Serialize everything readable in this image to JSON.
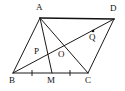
{
  "figure": {
    "background_color": "#ffffff",
    "stroke_color": "#1a1a1a",
    "points": {
      "A": {
        "label": "A",
        "x": 40,
        "y": 18,
        "label_x": 36,
        "label_y": 3
      },
      "B": {
        "label": "B",
        "x": 13,
        "y": 73,
        "label_x": 9,
        "label_y": 76
      },
      "C": {
        "label": "C",
        "x": 88,
        "y": 73,
        "label_x": 85,
        "label_y": 76
      },
      "D": {
        "label": "D",
        "x": 114,
        "y": 19,
        "label_x": 110,
        "label_y": 4
      },
      "M": {
        "label": "M",
        "x": 52,
        "y": 73,
        "label_x": 47,
        "label_y": 76
      },
      "O": {
        "label": "O",
        "x": 62,
        "y": 49,
        "label_x": 58,
        "label_y": 50
      },
      "P": {
        "label": "P",
        "x": 43,
        "y": 54,
        "label_x": 34,
        "label_y": 47
      },
      "Q": {
        "label": "Q",
        "x": 93,
        "y": 31,
        "label_x": 89,
        "label_y": 33
      }
    },
    "segments": [
      {
        "name": "side-AD",
        "from": "A",
        "to": "D",
        "weight": "thick"
      },
      {
        "name": "side-AB",
        "from": "A",
        "to": "B",
        "weight": "normal"
      },
      {
        "name": "side-BC",
        "from": "B",
        "to": "C",
        "weight": "normal"
      },
      {
        "name": "side-DC",
        "from": "D",
        "to": "C",
        "weight": "normal"
      },
      {
        "name": "median-AM",
        "from": "A",
        "to": "M",
        "weight": "normal"
      },
      {
        "name": "diagonal-AC",
        "from": "A",
        "to": "C",
        "weight": "normal"
      },
      {
        "name": "diagonal-BD",
        "from": "B",
        "to": "D",
        "weight": "normal"
      }
    ],
    "tick_marks": [
      {
        "name": "tick-BM",
        "x": 32,
        "y": 73
      },
      {
        "name": "tick-MC",
        "x": 70,
        "y": 73
      }
    ],
    "marked_points": [
      {
        "name": "point-Q-dot",
        "x": 93,
        "y": 31,
        "r": 1.3
      }
    ]
  }
}
